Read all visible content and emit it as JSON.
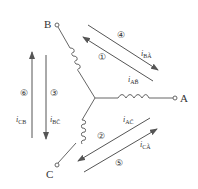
{
  "diagram": {
    "type": "star (Y) connected three-phase winding with line currents",
    "colors": {
      "line": "#555555",
      "text": "#333333",
      "background": "#ffffff"
    },
    "terminals": [
      {
        "id": "A",
        "label": "A"
      },
      {
        "id": "B",
        "label": "B"
      },
      {
        "id": "C",
        "label": "C"
      }
    ],
    "arrows": [
      {
        "number": "①",
        "current": "i",
        "subscript": "AB̃",
        "direction": "toward B"
      },
      {
        "number": "②",
        "current": "i",
        "subscript": "AC̃",
        "direction": "toward C"
      },
      {
        "number": "③",
        "current": "i",
        "subscript": "BC̃",
        "direction": "down (B to C)"
      },
      {
        "number": "④",
        "current": "i",
        "subscript": "BÃ",
        "direction": "toward A"
      },
      {
        "number": "⑤",
        "current": "i",
        "subscript": "CÃ",
        "direction": "toward A"
      },
      {
        "number": "⑥",
        "current": "i",
        "subscript": "CB",
        "direction": "up (C to B)"
      }
    ]
  }
}
